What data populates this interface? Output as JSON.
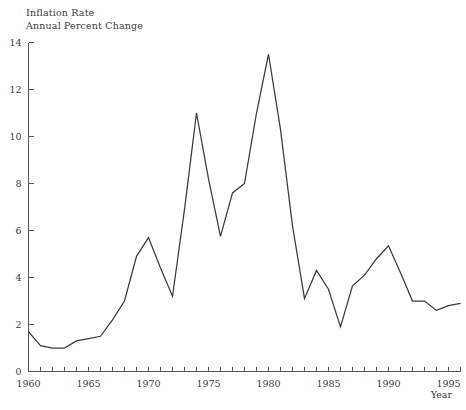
{
  "chart_data": {
    "type": "line",
    "title": "Inflation Rate",
    "subtitle": "Annual Percent Change",
    "xlabel": "Year",
    "ylabel": "",
    "xlim": [
      1960,
      1996
    ],
    "ylim": [
      0,
      14
    ],
    "grid": false,
    "legend": "none",
    "x_tick_labels": [
      "1960",
      "1965",
      "1970",
      "1975",
      "1980",
      "1985",
      "1990",
      "1995"
    ],
    "x_tick_values": [
      1960,
      1965,
      1970,
      1975,
      1980,
      1985,
      1990,
      1995
    ],
    "x_minor_tick_step": 1,
    "y_tick_labels": [
      "0",
      "2",
      "4",
      "6",
      "8",
      "10",
      "12",
      "14"
    ],
    "y_tick_values": [
      0,
      2,
      4,
      6,
      8,
      10,
      12,
      14
    ],
    "series": [
      {
        "name": "Inflation Rate",
        "color": "#3a3a3a",
        "x": [
          1960,
          1961,
          1962,
          1963,
          1964,
          1965,
          1966,
          1967,
          1968,
          1969,
          1970,
          1971,
          1972,
          1973,
          1974,
          1975,
          1976,
          1977,
          1978,
          1979,
          1980,
          1981,
          1982,
          1983,
          1984,
          1985,
          1986,
          1987,
          1988,
          1989,
          1990,
          1991,
          1992,
          1993,
          1994,
          1995,
          1996
        ],
        "values": [
          1.7,
          1.1,
          1.0,
          1.0,
          1.3,
          1.4,
          1.5,
          2.2,
          3.0,
          4.9,
          5.7,
          4.4,
          3.2,
          6.9,
          11.0,
          8.2,
          5.75,
          7.6,
          8.0,
          11.0,
          13.5,
          10.3,
          6.2,
          3.1,
          4.3,
          3.5,
          1.9,
          3.65,
          4.1,
          4.8,
          5.35,
          4.2,
          3.0,
          3.0,
          2.6,
          2.8,
          2.9
        ]
      }
    ]
  }
}
